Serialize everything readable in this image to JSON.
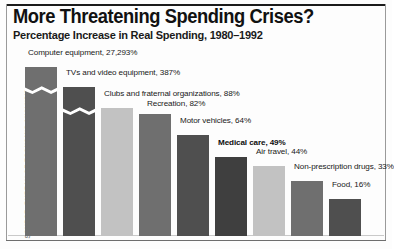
{
  "header": {
    "title": "More Threatening Spending Crises?",
    "subtitle": "Percentage Increase in Real Spending, 1980–1992"
  },
  "source_note": "SOURCE: BUREAU OF ECONOMIC ANALYSIS",
  "colors": {
    "bar_medium": "#6f6f6f",
    "bar_dark": "#4f4f4f",
    "bar_light": "#c2c2c2",
    "text": "#202020",
    "frame": "#1b1b1b",
    "background": "#ffffff"
  },
  "chart_data": {
    "type": "bar",
    "title": "More Threatening Spending Crises?",
    "subtitle": "Percentage Increase in Real Spending, 1980–1992",
    "xlabel": "",
    "ylabel": "Percentage increase in real spending",
    "grid": false,
    "legend": false,
    "axis_break": true,
    "axis_break_note": "Bars for Computer equipment and TVs and video equipment are truncated with a zigzag scale break because their values exceed the chart scale.",
    "value_unit": "%",
    "categories": [
      "Computer equipment",
      "TVs and video equipment",
      "Clubs and fraternal organizations",
      "Recreation",
      "Motor vehicles",
      "Medical care",
      "Air travel",
      "Non-prescription drugs",
      "Food"
    ],
    "values": [
      27293,
      387,
      88,
      82,
      64,
      49,
      44,
      33,
      16
    ],
    "value_labels": [
      "27,293%",
      "387%",
      "88%",
      "82%",
      "64%",
      "49%",
      "44%",
      "33%",
      "16%"
    ],
    "points": [
      {
        "label": "Computer equipment, 27,293%",
        "category": "Computer equipment",
        "value": 27293,
        "value_label": "27,293%",
        "color": "#6f6f6f",
        "emphasis": false,
        "broken": true
      },
      {
        "label": "TVs and video equipment, 387%",
        "category": "TVs and video equipment",
        "value": 387,
        "value_label": "387%",
        "color": "#4f4f4f",
        "emphasis": false,
        "broken": true
      },
      {
        "label": "Clubs and fraternal organizations, 88%",
        "category": "Clubs and fraternal organizations",
        "value": 88,
        "value_label": "88%",
        "color": "#c2c2c2",
        "emphasis": false,
        "broken": false
      },
      {
        "label": "Recreation, 82%",
        "category": "Recreation",
        "value": 82,
        "value_label": "82%",
        "color": "#6f6f6f",
        "emphasis": false,
        "broken": false
      },
      {
        "label": "Motor vehicles, 64%",
        "category": "Motor vehicles",
        "value": 64,
        "value_label": "64%",
        "color": "#4f4f4f",
        "emphasis": false,
        "broken": false
      },
      {
        "label": "Medical care, 49%",
        "category": "Medical care",
        "value": 49,
        "value_label": "49%",
        "color": "#3f3f3f",
        "emphasis": true,
        "broken": false
      },
      {
        "label": "Air travel, 44%",
        "category": "Air travel",
        "value": 44,
        "value_label": "44%",
        "color": "#c2c2c2",
        "emphasis": false,
        "broken": false
      },
      {
        "label": "Non-prescription drugs, 33%",
        "category": "Non-prescription drugs",
        "value": 33,
        "value_label": "33%",
        "color": "#6f6f6f",
        "emphasis": false,
        "broken": false
      },
      {
        "label": "Food, 16%",
        "category": "Food",
        "value": 16,
        "value_label": "16%",
        "color": "#4f4f4f",
        "emphasis": false,
        "broken": false
      }
    ]
  }
}
